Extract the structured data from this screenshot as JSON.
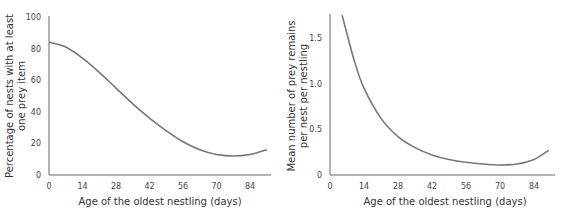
{
  "chart_data": [
    {
      "type": "line",
      "title": "",
      "xlabel": "Age of the oldest nestling (days)",
      "ylabel": "Percentage of nests with at least one prey item",
      "ylabel_lines": [
        "Percentage of nests with at least",
        "one prey item"
      ],
      "x_ticks": [
        "0",
        "14",
        "28",
        "42",
        "56",
        "70",
        "84"
      ],
      "y_ticks": [
        "0",
        "20",
        "40",
        "60",
        "80",
        "100"
      ],
      "xlim": [
        0,
        92
      ],
      "ylim": [
        0,
        100
      ],
      "grid": false,
      "series": [
        {
          "name": "Percentage of nests with prey",
          "x": [
            0,
            7,
            14,
            21,
            28,
            35,
            42,
            49,
            56,
            63,
            70,
            77,
            84,
            91
          ],
          "values": [
            84,
            81,
            74,
            65,
            55,
            45,
            36,
            28,
            21,
            16,
            13,
            12,
            13,
            16
          ]
        }
      ]
    },
    {
      "type": "line",
      "title": "",
      "xlabel": "Age of the oldest nestling (days)",
      "ylabel": "Mean number of prey remains per nest per nestling",
      "ylabel_lines": [
        "Mean number of prey remains",
        "per nest per nestling"
      ],
      "x_ticks": [
        "0",
        "14",
        "28",
        "42",
        "56",
        "70",
        "84"
      ],
      "y_ticks": [
        "0",
        "0.5",
        "1.0",
        "1.5"
      ],
      "xlim": [
        0,
        92
      ],
      "ylim": [
        0,
        1.75
      ],
      "grid": false,
      "series": [
        {
          "name": "Mean prey remains per nest per nestling",
          "x": [
            5,
            10,
            14,
            21,
            28,
            35,
            42,
            49,
            56,
            63,
            70,
            77,
            84,
            90
          ],
          "values": [
            1.75,
            1.25,
            0.95,
            0.62,
            0.42,
            0.3,
            0.22,
            0.17,
            0.14,
            0.12,
            0.11,
            0.12,
            0.17,
            0.27
          ]
        }
      ]
    }
  ]
}
